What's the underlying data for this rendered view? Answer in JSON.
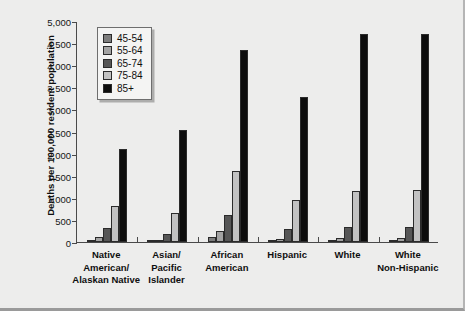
{
  "chart_data": {
    "type": "bar",
    "title": "",
    "xlabel": "",
    "ylabel": "Deaths per 100,000 resident population",
    "ylim": [
      0,
      5000
    ],
    "ytick_labels": [
      "0",
      "500",
      "1,000",
      "1,500",
      "2,000",
      "2,500",
      "3,000",
      "3,500",
      "4,000",
      "4,500",
      "5,000"
    ],
    "ytick_values": [
      0,
      500,
      1000,
      1500,
      2000,
      2500,
      3000,
      3500,
      4000,
      4500,
      5000
    ],
    "grid": false,
    "legend_position": "upper-left-inside",
    "categories": [
      "Native American/ Alaskan Native",
      "Asian/ Pacific Islander",
      "African American",
      "Hispanic",
      "White",
      "White Non-Hispanic"
    ],
    "category_lines": [
      [
        "Native",
        "American/",
        "Alaskan Native"
      ],
      [
        "Asian/",
        "Pacific",
        "Islander"
      ],
      [
        "African",
        "American"
      ],
      [
        "Hispanic"
      ],
      [
        "White"
      ],
      [
        "White",
        "Non-Hispanic"
      ]
    ],
    "series": [
      {
        "name": "45-54",
        "color": "#7d7d7d",
        "values": [
          50,
          30,
          110,
          20,
          25,
          25
        ]
      },
      {
        "name": "55-64",
        "color": "#a3a3a3",
        "values": [
          115,
          55,
          250,
          70,
          80,
          80
        ]
      },
      {
        "name": "65-74",
        "color": "#565656",
        "values": [
          320,
          190,
          610,
          290,
          330,
          330
        ]
      },
      {
        "name": "75-84",
        "color": "#c2c2c2",
        "values": [
          810,
          650,
          1600,
          950,
          1160,
          1170
        ]
      },
      {
        "name": "85+",
        "color": "#0d0d0d",
        "values": [
          2110,
          2530,
          4340,
          3290,
          4700,
          4710
        ]
      }
    ]
  },
  "legend": {
    "items": [
      {
        "label": "45-54",
        "swatch": "legend-swatch-45-54"
      },
      {
        "label": "55-64",
        "swatch": "legend-swatch-55-64"
      },
      {
        "label": "65-74",
        "swatch": "legend-swatch-65-74"
      },
      {
        "label": "75-84",
        "swatch": "legend-swatch-75-84"
      },
      {
        "label": "85+",
        "swatch": "legend-swatch-85plus"
      }
    ]
  }
}
